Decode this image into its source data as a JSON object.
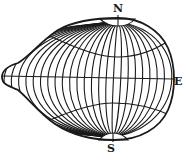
{
  "figure": {
    "stroke_color": "#1a1a1a",
    "background": "#ffffff",
    "labels": {
      "north": "N",
      "south": "S",
      "east": "E"
    },
    "meridian_count": 28,
    "parallels": [
      "upper-parallel",
      "equator",
      "lower-parallel"
    ]
  }
}
